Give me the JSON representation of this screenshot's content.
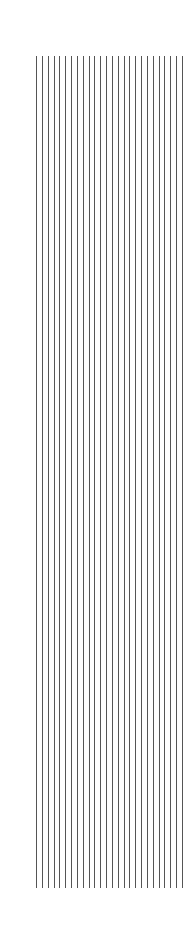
{
  "figure": {
    "type": "vertical-line-pattern",
    "line_count": 26,
    "first_x": 36,
    "spacing": 5.84,
    "top": 56,
    "bottom": 888,
    "line_color": "#555555",
    "background": "#ffffff"
  }
}
